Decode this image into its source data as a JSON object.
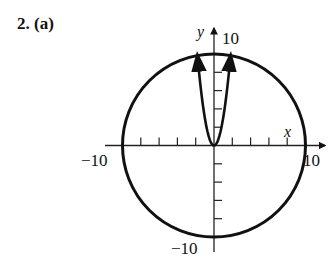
{
  "problem_label": "2.  (a)",
  "chart_data": {
    "type": "line",
    "title": "",
    "xlabel": "x",
    "ylabel": "y",
    "xlim": [
      -10,
      10
    ],
    "ylim": [
      -10,
      10
    ],
    "grid": false,
    "tick_labels": {
      "x_min": "−10",
      "x_max": "10",
      "y_min": "−10",
      "y_max": "10"
    },
    "tick_step": 2,
    "series": [
      {
        "name": "circle",
        "equation": "x^2 + y^2 = 100",
        "radius": 10
      },
      {
        "name": "parabola",
        "equation": "y = 3x^2",
        "x_range": [
          -1.75,
          1.75
        ],
        "arrows": true
      }
    ]
  }
}
